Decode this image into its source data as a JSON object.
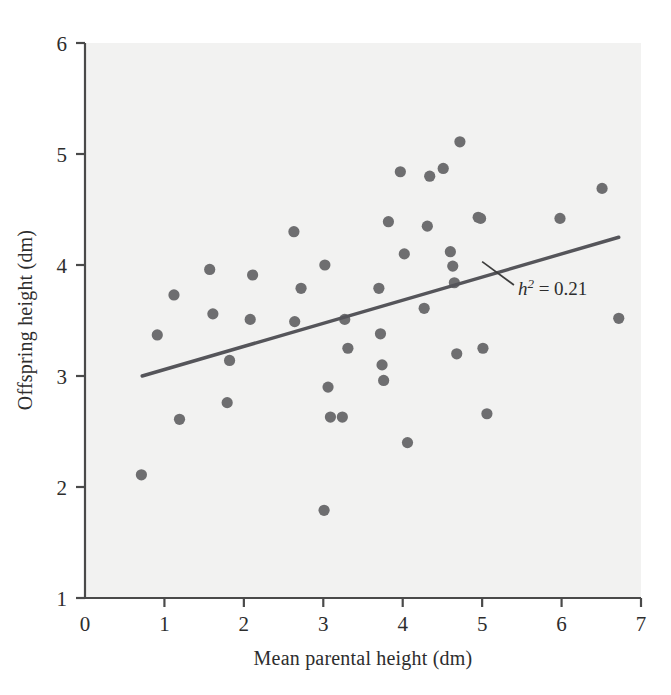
{
  "chart_data": {
    "type": "scatter",
    "title": "",
    "xlabel": "Mean parental height (dm)",
    "ylabel": "Offspring height (dm)",
    "xlim": [
      0,
      7
    ],
    "ylim": [
      1,
      6
    ],
    "xticks": [
      "0",
      "1",
      "2",
      "3",
      "4",
      "5",
      "6",
      "7"
    ],
    "yticks": [
      "1",
      "2",
      "3",
      "4",
      "5",
      "6"
    ],
    "grid": false,
    "legend": "none",
    "point_color": "#6e6e70",
    "line_color": "#55555a",
    "background_color": "#f2f2f1",
    "annotations": [
      {
        "name": "heritability-label",
        "text_italic": "h",
        "text_sup": "2",
        "text_rest": " = 0.21",
        "full_text": "h2 = 0.21",
        "x": 5.45,
        "y": 3.79,
        "leader_from": [
          5.0,
          4.03
        ],
        "leader_to": [
          5.4,
          3.82
        ]
      }
    ],
    "trendline": {
      "name": "regression-line",
      "x_start": 0.72,
      "y_start": 3.0,
      "x_end": 6.72,
      "y_end": 4.25
    },
    "points": [
      {
        "x": 0.71,
        "y": 2.11
      },
      {
        "x": 0.91,
        "y": 3.37
      },
      {
        "x": 1.12,
        "y": 3.73
      },
      {
        "x": 1.19,
        "y": 2.61
      },
      {
        "x": 1.57,
        "y": 3.96
      },
      {
        "x": 1.61,
        "y": 3.56
      },
      {
        "x": 1.79,
        "y": 2.76
      },
      {
        "x": 1.82,
        "y": 3.14
      },
      {
        "x": 2.11,
        "y": 3.91
      },
      {
        "x": 2.08,
        "y": 3.51
      },
      {
        "x": 2.63,
        "y": 4.3
      },
      {
        "x": 2.64,
        "y": 3.49
      },
      {
        "x": 2.72,
        "y": 3.79
      },
      {
        "x": 3.01,
        "y": 1.79
      },
      {
        "x": 3.02,
        "y": 4.0
      },
      {
        "x": 3.06,
        "y": 2.9
      },
      {
        "x": 3.09,
        "y": 2.63
      },
      {
        "x": 3.24,
        "y": 2.63
      },
      {
        "x": 3.27,
        "y": 3.51
      },
      {
        "x": 3.31,
        "y": 3.25
      },
      {
        "x": 3.7,
        "y": 3.79
      },
      {
        "x": 3.72,
        "y": 3.38
      },
      {
        "x": 3.74,
        "y": 3.1
      },
      {
        "x": 3.76,
        "y": 2.96
      },
      {
        "x": 3.82,
        "y": 4.39
      },
      {
        "x": 3.97,
        "y": 4.84
      },
      {
        "x": 4.02,
        "y": 4.1
      },
      {
        "x": 4.06,
        "y": 2.4
      },
      {
        "x": 4.27,
        "y": 3.61
      },
      {
        "x": 4.31,
        "y": 4.35
      },
      {
        "x": 4.34,
        "y": 4.8
      },
      {
        "x": 4.51,
        "y": 4.87
      },
      {
        "x": 4.6,
        "y": 4.12
      },
      {
        "x": 4.63,
        "y": 3.99
      },
      {
        "x": 4.65,
        "y": 3.84
      },
      {
        "x": 4.68,
        "y": 3.2
      },
      {
        "x": 4.72,
        "y": 5.11
      },
      {
        "x": 4.95,
        "y": 4.43
      },
      {
        "x": 4.98,
        "y": 4.42
      },
      {
        "x": 5.01,
        "y": 3.25
      },
      {
        "x": 5.06,
        "y": 2.66
      },
      {
        "x": 5.98,
        "y": 4.42
      },
      {
        "x": 6.51,
        "y": 4.69
      },
      {
        "x": 6.72,
        "y": 3.52
      }
    ]
  }
}
